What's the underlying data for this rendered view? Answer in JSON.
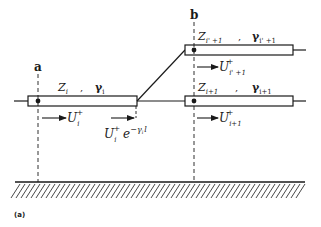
{
  "diagram": {
    "type": "transmission-line-junction",
    "caption": "(a)",
    "nodes": {
      "a": {
        "label": "a"
      },
      "b": {
        "label": "b"
      }
    },
    "lines": [
      {
        "id": "line-i",
        "impedance_base": "Z",
        "impedance_sub": "i",
        "gamma_base": "γ",
        "gamma_sub": "i",
        "wave_base": "U",
        "wave_sub": "i",
        "wave_sup": "+"
      },
      {
        "id": "line-i-prime-plus-1",
        "impedance_base": "Z",
        "impedance_sub": "i' +1",
        "gamma_base": "γ",
        "gamma_sub": "i' +1",
        "wave_base": "U",
        "wave_sub": "i' +1",
        "wave_sup": "+"
      },
      {
        "id": "line-i-plus-1",
        "impedance_base": "Z",
        "impedance_sub": "i+1",
        "gamma_base": "γ",
        "gamma_sub": "i+1",
        "wave_base": "U",
        "wave_sub": "i+1",
        "wave_sup": "+"
      }
    ],
    "attenuated_wave": {
      "base": "U",
      "sub": "i",
      "sup": "+",
      "exp_base": "e",
      "exp_power": "−γ",
      "exp_power_sub": "i",
      "exp_power_tail": "l"
    },
    "separator": ",",
    "ground": {
      "label": "ground-plane"
    },
    "colors": {
      "ink": "#1a1a1a",
      "background": "#ffffff"
    }
  }
}
